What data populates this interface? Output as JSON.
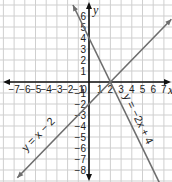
{
  "chart_data": {
    "type": "line",
    "title": "",
    "xlabel": "x",
    "ylabel": "y",
    "xlim": [
      -8,
      7.5
    ],
    "ylim": [
      -8.5,
      7
    ],
    "grid": true,
    "x_ticks": [
      -7,
      -6,
      -5,
      -4,
      -3,
      -2,
      -1,
      0,
      1,
      2,
      3,
      4,
      5,
      6,
      7
    ],
    "y_ticks": [
      6,
      5,
      4,
      3,
      2,
      1,
      -1,
      -2,
      -3,
      -4,
      -5,
      -6,
      -7,
      -8
    ],
    "series": [
      {
        "name": "y = x − 2",
        "slope": 1,
        "intercept": -2,
        "x_range": [
          -6.7,
          7.7
        ],
        "color": "#6e6e6e"
      },
      {
        "name": "y = −2x + 4",
        "slope": -2,
        "intercept": 4,
        "x_range": [
          -1.5,
          6.9
        ],
        "color": "#6e6e6e"
      }
    ],
    "annotations": [
      {
        "text": "y = x − 2",
        "x": -4.5,
        "y": -5
      },
      {
        "text": "y = −2x + 4",
        "x": 4.3,
        "y": -3.5
      }
    ],
    "intersection": {
      "x": 2,
      "y": 0
    }
  }
}
